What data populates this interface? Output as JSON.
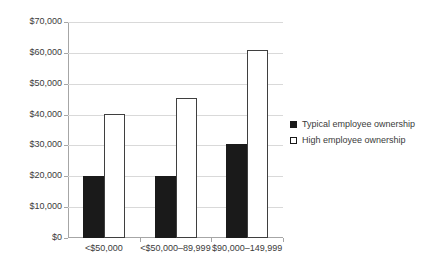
{
  "chart_data": {
    "type": "bar",
    "title": "",
    "subtitle": "",
    "xlabel": "",
    "ylabel": "",
    "ylim": [
      0,
      70000
    ],
    "ytick_step": 10000,
    "ytick_labels": [
      "$0",
      "$10,000",
      "$20,000",
      "$30,000",
      "$40,000",
      "$50,000",
      "$60,000",
      "$70,000"
    ],
    "ytick_values": [
      0,
      10000,
      20000,
      30000,
      40000,
      50000,
      60000,
      70000
    ],
    "grid": true,
    "legend_position": "right",
    "categories": [
      "<$50,000",
      "<$50,000–89,999",
      "$90,000–149,999"
    ],
    "series": [
      {
        "name": "Typical employee ownership",
        "color": "#1a1a1a",
        "fill": "solid",
        "values": [
          20000,
          20000,
          30500
        ]
      },
      {
        "name": "High employee ownership",
        "color": "#ffffff",
        "fill": "hollow",
        "values": [
          40300,
          45500,
          60800
        ]
      }
    ]
  },
  "legend": {
    "items": [
      {
        "label": "Typical employee ownership",
        "swatch": "filled-square-marker"
      },
      {
        "label": "High employee ownership",
        "swatch": "hollow-square-marker"
      }
    ]
  }
}
